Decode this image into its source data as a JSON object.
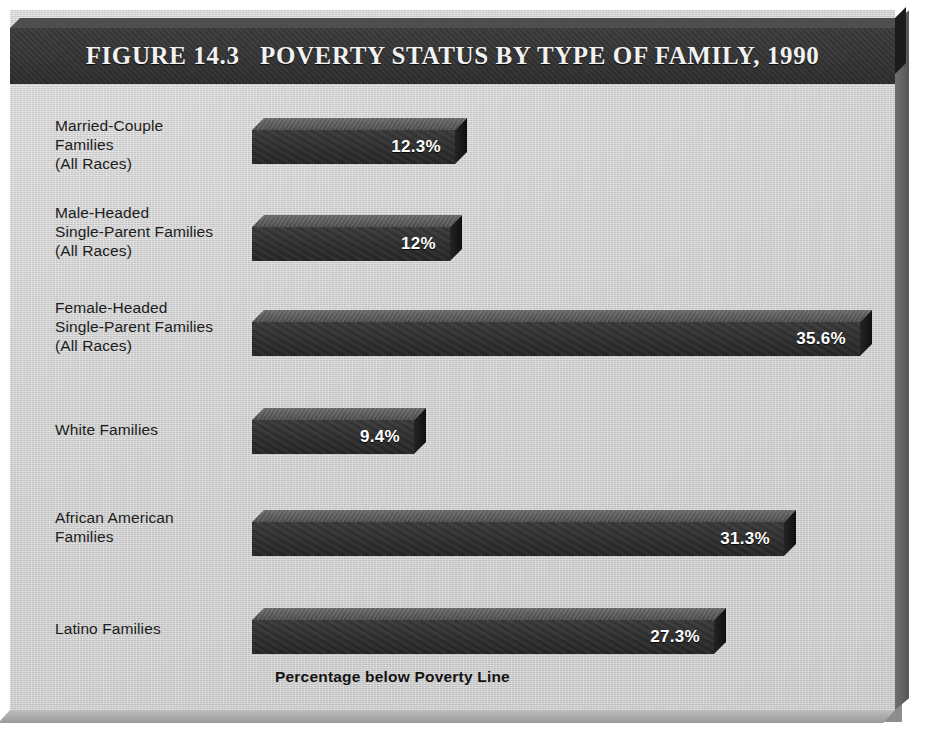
{
  "figure": {
    "title": "FIGURE 14.3   POVERTY STATUS BY TYPE OF FAMILY, 1990",
    "axis_caption": "Percentage below Poverty Line",
    "colors": {
      "panel_background": "#d2d2d2",
      "title_band": "#333333",
      "title_text": "#f2f2f2",
      "bar_face": "#2d2d2d",
      "bar_top": "#5a5a5a",
      "bar_side": "#181818",
      "value_text": "#ffffff",
      "label_text": "#1c1c1c"
    }
  },
  "chart_data": {
    "type": "bar",
    "orientation": "horizontal",
    "title": "FIGURE 14.3   POVERTY STATUS BY TYPE OF FAMILY, 1990",
    "xlabel": "Percentage below Poverty Line",
    "ylabel": "",
    "xlim": [
      0,
      40
    ],
    "grid": false,
    "legend": false,
    "units": "percent",
    "categories": [
      "Married-Couple Families (All Races)",
      "Male-Headed Single-Parent Families (All Races)",
      "Female-Headed Single-Parent Families (All Races)",
      "White Families",
      "African American Families",
      "Latino Families"
    ],
    "values": [
      12.3,
      12,
      35.6,
      9.4,
      31.3,
      27.3
    ],
    "data_labels": [
      "12.3%",
      "12%",
      "35.6%",
      "9.4%",
      "31.3%",
      "27.3%"
    ]
  },
  "bars": [
    {
      "label": "Married-Couple\nFamilies\n(All Races)",
      "value_label": "12.3%",
      "value": 12.3,
      "label_top": 26,
      "bar_top": 28,
      "bar_width": 203
    },
    {
      "label": "Male-Headed\nSingle-Parent Families\n(All Races)",
      "value_label": "12%",
      "value": 12,
      "label_top": 113,
      "bar_top": 125,
      "bar_width": 198
    },
    {
      "label": "Female-Headed\nSingle-Parent Families\n(All Races)",
      "value_label": "35.6%",
      "value": 35.6,
      "label_top": 208,
      "bar_top": 220,
      "bar_width": 608
    },
    {
      "label": "White Families",
      "value_label": "9.4%",
      "value": 9.4,
      "label_top": 330,
      "bar_top": 318,
      "bar_width": 162
    },
    {
      "label": "African American\nFamilies",
      "value_label": "31.3%",
      "value": 31.3,
      "label_top": 418,
      "bar_top": 420,
      "bar_width": 532
    },
    {
      "label": "Latino Families",
      "value_label": "27.3%",
      "value": 27.3,
      "label_top": 529,
      "bar_top": 518,
      "bar_width": 462
    }
  ]
}
